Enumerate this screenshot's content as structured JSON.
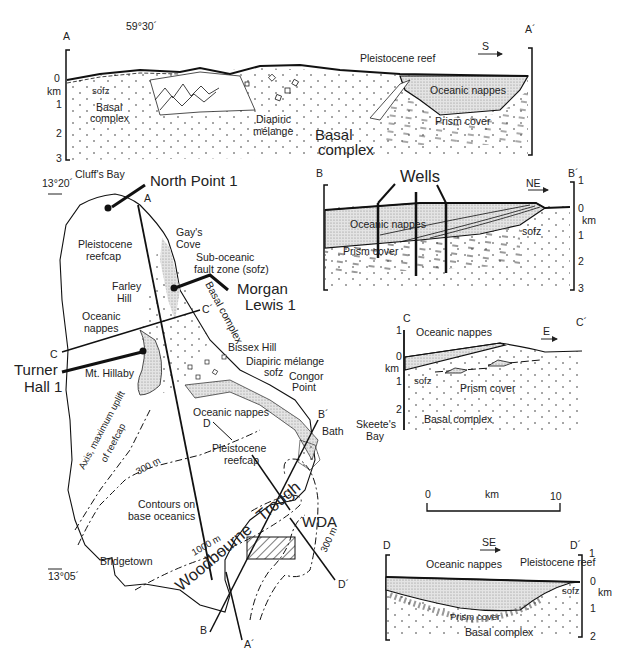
{
  "figure": {
    "type": "geological map and cross-sections"
  },
  "section_A": {
    "start_label": "A",
    "end_label": "A´",
    "longitude_label": "59°30´",
    "direction": "S",
    "depth_unit": "km",
    "depth_ticks": [
      "0",
      "1",
      "2",
      "3"
    ],
    "units": {
      "pleistocene_reef": "Pleistocene reef",
      "oceanic_nappes": "Oceanic nappes",
      "sofz": "sofz",
      "basal_complex_left": "Basal complex",
      "diapiric_melange": "Diapiric mélange",
      "basal_complex_main": "Basal complex",
      "prism_cover": "Prism cover"
    }
  },
  "section_B": {
    "start_label": "B",
    "end_label": "B´",
    "direction": "NE",
    "depth_unit": "km",
    "depth_ticks": [
      "1",
      "0",
      "1",
      "2",
      "3"
    ],
    "units": {
      "wells": "Wells",
      "oceanic_nappes": "Oceanic nappes",
      "prism_cover": "Prism cover",
      "sofz": "sofz"
    }
  },
  "section_C": {
    "start_label": "C",
    "end_label": "C´",
    "direction": "E",
    "depth_unit": "km",
    "depth_ticks": [
      "1",
      "0",
      "1",
      "2"
    ],
    "units": {
      "oceanic_nappes": "Oceanic nappes",
      "sofz": "sofz",
      "prism_cover": "Prism cover",
      "basal_complex": "Basal complex"
    }
  },
  "section_D": {
    "start_label": "D",
    "end_label": "D´",
    "direction": "SE",
    "depth_unit": "km",
    "depth_ticks": [
      "1",
      "0",
      "1",
      "2"
    ],
    "units": {
      "oceanic_nappes": "Oceanic nappes",
      "pleistocene_reef": "Pleistocene reef",
      "sofz": "sofz",
      "prism_cover": "Prism cover",
      "basal_complex": "Basal complex"
    }
  },
  "map": {
    "latitude_top": "13°20´",
    "latitude_bottom": "13°05´",
    "wells": {
      "north_point": "North Point 1",
      "morgan_lewis_1": "Morgan",
      "morgan_lewis_2": "Lewis 1",
      "turner_hall_1": "Turner",
      "turner_hall_2": "Hall 1"
    },
    "places": {
      "cliffs_bay": "Cluff's Bay",
      "gays_cove_1": "Gay's",
      "gays_cove_2": "Cove",
      "farley_hill_1": "Farley",
      "farley_hill_2": "Hill",
      "mt_hillaby": "Mt. Hillaby",
      "bissex_hill": "Bissex Hill",
      "congor_point_1": "Congor",
      "congor_point_2": "Point",
      "bath": "Bath",
      "skeetes_bay_1": "Skeete's",
      "skeetes_bay_2": "Bay",
      "bridgetown": "Bridgetown"
    },
    "units": {
      "pleistocene_reefcap_n_1": "Pleistocene",
      "pleistocene_reefcap_n_2": "reefcap",
      "sofz_1": "Sub-oceanic",
      "sofz_2": "fault zone (sofz)",
      "basal_complex": "Basal complex",
      "oceanic_nappes_1": "Oceanic",
      "oceanic_nappes_2": "nappes",
      "diapiric_melange": "Diapiric mélange",
      "sofz_short": "sofz",
      "oceanic_nappes_s": "Oceanic nappes",
      "pleistocene_reefcap_s_1": "Pleistocene",
      "pleistocene_reefcap_s_2": "reefcap",
      "axis_1": "Axis, maximum uplift",
      "axis_2": "of reefcap",
      "contours_1": "Contours on",
      "contours_2": "base oceanics",
      "contour_300_w": "300 m",
      "contour_1000": "1000 m",
      "contour_300_e": "300 m",
      "woodbourne": "Woodbourne",
      "trough": "Trough",
      "wda": "WDA"
    },
    "section_line_labels": {
      "a": "A",
      "a_end": "A´",
      "b": "B",
      "b_end": "B´",
      "c": "C",
      "c_end": "C´",
      "d": "D",
      "d_end": "D´"
    }
  },
  "scale_bar": {
    "start": "0",
    "end": "10",
    "unit": "km"
  }
}
